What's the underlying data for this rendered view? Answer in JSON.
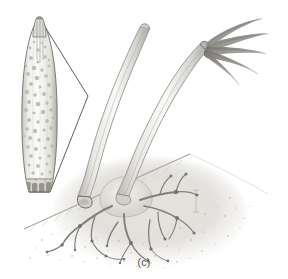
{
  "figure": {
    "caption": "(c)",
    "panel_label": "(c)",
    "background_color": "#ffffff",
    "ink_color": "#8a8a8a",
    "dark_ink_color": "#5a5a5a",
    "line_color": "#4a4a4a",
    "soil_tone": "#d7d5cf",
    "rhizoid_color": "#7d7a74",
    "granule_color": "#b9b7b0",
    "style": "graphite pencil scientific illustration"
  },
  "inset": {
    "name": "magnified-spore-body",
    "description": "fusiform spindle-shaped body with internal granules",
    "granule_count": 58,
    "outline_color": "#777570",
    "fill_color": "#f3f2ef",
    "basal_segments": 5,
    "position": {
      "x": 18,
      "y": 18,
      "width": 42,
      "height": 178
    }
  },
  "callout": {
    "name": "callout-leader-lines",
    "vertex": {
      "x": 88,
      "y": 96
    },
    "line_count": 2,
    "from_top": {
      "x": 42,
      "y": 22
    },
    "from_bottom": {
      "x": 50,
      "y": 192
    },
    "color": "#4a4a4a"
  },
  "stalks": [
    {
      "name": "closed-stalk-left",
      "label": "undehisced stalk",
      "tip": {
        "x": 143,
        "y": 29
      },
      "base": {
        "x": 78,
        "y": 190
      },
      "state": "closed tip"
    },
    {
      "name": "dehisced-stalk-right",
      "label": "dehisced stalk with spreading filaments",
      "tip": {
        "x": 203,
        "y": 46
      },
      "base": {
        "x": 118,
        "y": 188
      },
      "state": "open, filaments released",
      "filament_count": 5
    }
  ],
  "substrate": {
    "name": "soil-surface",
    "ground_line_start": {
      "x": 24,
      "y": 228
    },
    "ground_line_end": {
      "x": 190,
      "y": 155
    },
    "stipple_density": "medium"
  },
  "rhizoids": {
    "name": "branching-rhizoid-network",
    "description": "branching root-like mycelial network below the soil line",
    "origin": {
      "x": 122,
      "y": 190
    },
    "branch_count": 9,
    "color": "#7a7771"
  },
  "scale_mark": {
    "name": "artist-scale-mark",
    "position": {
      "x": 196,
      "y": 196
    },
    "height": 22
  }
}
